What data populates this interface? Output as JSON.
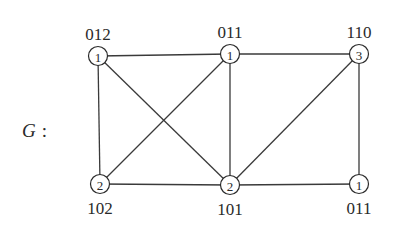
{
  "graph": {
    "name": "G",
    "name_suffix": ":",
    "nodes": [
      {
        "id": "a",
        "weight": "1",
        "label": "012",
        "x": 98,
        "y": 56,
        "label_pos": "above"
      },
      {
        "id": "b",
        "weight": "1",
        "label": "011",
        "x": 230,
        "y": 54,
        "label_pos": "above"
      },
      {
        "id": "c",
        "weight": "3",
        "label": "110",
        "x": 359,
        "y": 54,
        "label_pos": "above"
      },
      {
        "id": "d",
        "weight": "2",
        "label": "102",
        "x": 100,
        "y": 184,
        "label_pos": "below"
      },
      {
        "id": "e",
        "weight": "2",
        "label": "101",
        "x": 230,
        "y": 185,
        "label_pos": "below"
      },
      {
        "id": "f",
        "weight": "1",
        "label": "011",
        "x": 359,
        "y": 184,
        "label_pos": "below"
      }
    ],
    "edges": [
      [
        "a",
        "b"
      ],
      [
        "b",
        "c"
      ],
      [
        "a",
        "d"
      ],
      [
        "a",
        "e"
      ],
      [
        "b",
        "d"
      ],
      [
        "b",
        "e"
      ],
      [
        "c",
        "e"
      ],
      [
        "c",
        "f"
      ],
      [
        "d",
        "e"
      ],
      [
        "e",
        "f"
      ]
    ]
  }
}
